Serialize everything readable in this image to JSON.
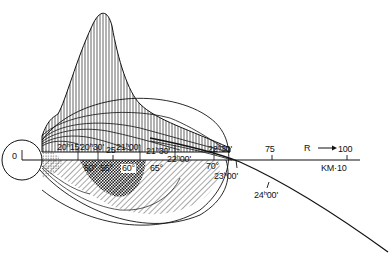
{
  "diagram": {
    "origin_label": "0",
    "axis": {
      "unit_label": "KM·10",
      "direction_label": "R →",
      "ticks": [
        "25",
        "75",
        "100"
      ]
    },
    "time_labels": [
      {
        "h": "20",
        "m": "15'"
      },
      {
        "h": "20",
        "m": "30'"
      },
      {
        "h": "21",
        "m": "00'"
      },
      {
        "h": "21",
        "m": "30'"
      },
      {
        "h": "22",
        "m": "00'"
      },
      {
        "h": "22",
        "m": "30'"
      },
      {
        "h": "23",
        "m": "00'"
      },
      {
        "h": "24",
        "m": "00'"
      }
    ],
    "angle_labels": [
      "50°",
      "55°",
      "60°",
      "65°",
      "70°"
    ],
    "colors": {
      "ink": "#1a1a1a",
      "background": "#ffffff"
    }
  }
}
